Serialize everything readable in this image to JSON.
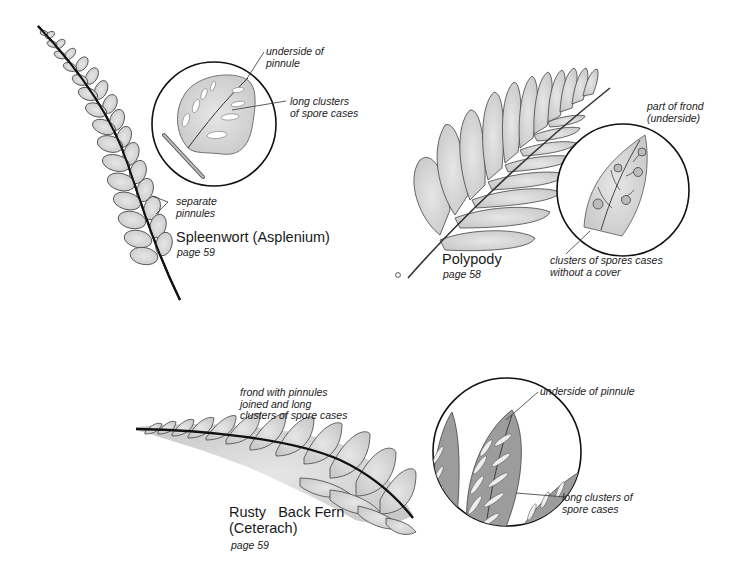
{
  "figure": {
    "type": "botanical illustration",
    "colors": {
      "background": "#ffffff",
      "leaf_fill": "#d9d9d9",
      "leaf_dark": "#9a9a9a",
      "line": "#222222"
    }
  },
  "spleenwort": {
    "title": "Spleenwort (Asplenium)",
    "page": "page 59",
    "labels": {
      "pinnules": "separate\npinnules",
      "underside": "underside of\npinnule",
      "clusters": "long clusters\nof spore cases"
    }
  },
  "polypody": {
    "title": "Polypody",
    "page": "page 58",
    "labels": {
      "frond": "part of frond\n(underside)",
      "clusters": "clusters of spores cases\nwithout a cover"
    }
  },
  "rustyback": {
    "title": "Rusty   Back Fern\n(Ceterach)",
    "page": "page 59",
    "labels": {
      "frond": "frond with pinnules\njoined and long\nclusters of spore cases",
      "underside": "underside of pinnule",
      "clusters": "long clusters of\nspore cases"
    }
  }
}
